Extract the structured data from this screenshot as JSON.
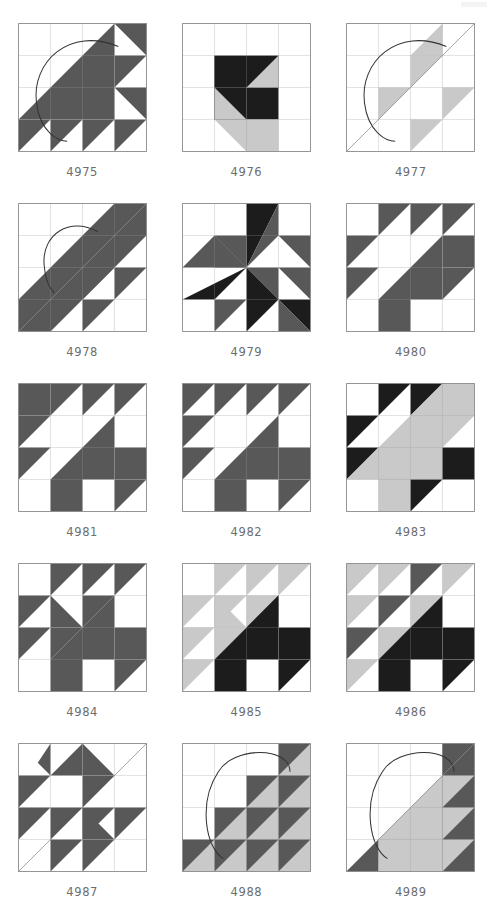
{
  "page": {
    "type": "quilt-block-pattern-catalog",
    "columns": 3,
    "rows": 5,
    "background": "#ffffff"
  },
  "palette": {
    "white": "#ffffff",
    "light_gray": "#c9c9c9",
    "mid_gray": "#585858",
    "dark": "#1c1c1c",
    "outline": "#8a8a8a",
    "curve_stroke": "#333333",
    "label_color": "#6d6d6d"
  },
  "blocks": [
    {
      "id": "4975",
      "label": "4975",
      "grid": 4,
      "has_curve": true,
      "curve_style": "teardrop-large",
      "shapes": [
        {
          "t": "poly",
          "p": "0,3 3,0 3,3",
          "c": "mid"
        },
        {
          "t": "poly",
          "p": "3,0 4,0 4,1",
          "c": "mid"
        },
        {
          "t": "poly",
          "p": "3,1 4,1 3,2",
          "c": "mid"
        },
        {
          "t": "poly",
          "p": "3,2 4,2 4,3",
          "c": "mid"
        },
        {
          "t": "poly",
          "p": "3,3 4,3 3,4",
          "c": "mid"
        },
        {
          "t": "poly",
          "p": "0,3 1,3 0,4",
          "c": "mid"
        },
        {
          "t": "poly",
          "p": "1,3 2,3 1,4",
          "c": "mid"
        },
        {
          "t": "poly",
          "p": "2,3 3,3 2,4",
          "c": "mid"
        }
      ]
    },
    {
      "id": "4976",
      "label": "4976",
      "grid": 4,
      "has_curve": false,
      "shapes": [
        {
          "t": "rect",
          "p": "1,1,2,1",
          "c": "dark"
        },
        {
          "t": "rect",
          "p": "1,2,1,1",
          "c": "dark"
        },
        {
          "t": "poly",
          "p": "1,1 2,2 1,2",
          "c": "dark"
        },
        {
          "t": "poly",
          "p": "1,2 2,2 2,3 1,3",
          "c": "dark"
        },
        {
          "t": "poly",
          "p": "2,2 3,2 3,3 2,3",
          "c": "dark"
        },
        {
          "t": "poly",
          "p": "1,2 2,3 1,3",
          "c": "light"
        },
        {
          "t": "poly",
          "p": "3,1 3,2 2,2",
          "c": "light"
        },
        {
          "t": "poly",
          "p": "1,3 3,3 3,4 2,4",
          "c": "light"
        }
      ]
    },
    {
      "id": "4977",
      "label": "4977",
      "grid": 4,
      "has_curve": true,
      "curve_style": "teardrop-large",
      "shapes": [
        {
          "t": "poly",
          "p": "1,2 2,2 1,3",
          "c": "light"
        },
        {
          "t": "poly",
          "p": "2,1 3,1 2,2",
          "c": "light"
        },
        {
          "t": "poly",
          "p": "3,0 3,1 2,1",
          "c": "light"
        },
        {
          "t": "poly",
          "p": "2,3 3,3 2,4",
          "c": "light"
        },
        {
          "t": "poly",
          "p": "3,2 4,2 3,3",
          "c": "light"
        }
      ]
    },
    {
      "id": "4978",
      "label": "4978",
      "grid": 4,
      "has_curve": true,
      "curve_style": "teardrop-small",
      "shapes": [
        {
          "t": "poly",
          "p": "0,3 3,0 4,0 4,1 1,4 0,4",
          "c": "mid"
        },
        {
          "t": "poly",
          "p": "2,1 3,1 2,2",
          "c": "mid"
        },
        {
          "t": "poly",
          "p": "2,2 3,2 2,3",
          "c": "mid"
        },
        {
          "t": "poly",
          "p": "1,2 2,2 1,3",
          "c": "mid"
        },
        {
          "t": "poly",
          "p": "3,2 4,2 3,3",
          "c": "mid"
        },
        {
          "t": "poly",
          "p": "2,3 3,3 2,4",
          "c": "mid"
        }
      ]
    },
    {
      "id": "4979",
      "label": "4979",
      "grid": 4,
      "has_curve": false,
      "curve_style": "star-burst",
      "shapes": [
        {
          "t": "poly",
          "p": "1,1 2,1 2,2",
          "c": "mid"
        },
        {
          "t": "poly",
          "p": "1,1 2,2 1,2",
          "c": "mid"
        },
        {
          "t": "poly",
          "p": "2,0 2,2 3,0",
          "c": "dark"
        },
        {
          "t": "poly",
          "p": "2,2 3,0 3,1",
          "c": "mid"
        },
        {
          "t": "poly",
          "p": "3,1 4,1 4,2",
          "c": "mid"
        },
        {
          "t": "poly",
          "p": "0,2 2,2 1,1",
          "c": "mid"
        },
        {
          "t": "poly",
          "p": "0,3 2,2 1,3",
          "c": "dark"
        },
        {
          "t": "poly",
          "p": "2,2 3,2 3,3",
          "c": "mid"
        },
        {
          "t": "poly",
          "p": "2,2 3,3 2,4",
          "c": "dark"
        },
        {
          "t": "poly",
          "p": "3,2 4,2 4,3",
          "c": "mid"
        },
        {
          "t": "poly",
          "p": "1,3 2,3 1,4",
          "c": "mid"
        },
        {
          "t": "poly",
          "p": "3,3 4,3 4,4",
          "c": "dark"
        },
        {
          "t": "poly",
          "p": "3,3 4,4 3,4",
          "c": "mid"
        }
      ]
    },
    {
      "id": "4980",
      "label": "4980",
      "grid": 4,
      "has_curve": false,
      "shapes": [
        {
          "t": "poly",
          "p": "1,0 2,0 1,1",
          "c": "mid"
        },
        {
          "t": "poly",
          "p": "2,0 3,0 2,1",
          "c": "mid"
        },
        {
          "t": "poly",
          "p": "3,0 4,0 3,1",
          "c": "mid"
        },
        {
          "t": "poly",
          "p": "0,1 1,1 0,2",
          "c": "mid"
        },
        {
          "t": "poly",
          "p": "0,2 1,2 0,3",
          "c": "mid"
        },
        {
          "t": "poly",
          "p": "1,3 3,1 3,3 2,3 2,4 1,4",
          "c": "mid"
        },
        {
          "t": "poly",
          "p": "3,1 4,1 4,2 3,2",
          "c": "mid"
        },
        {
          "t": "poly",
          "p": "3,2 4,2 3,3",
          "c": "mid"
        }
      ]
    },
    {
      "id": "4981",
      "label": "4981",
      "grid": 4,
      "has_curve": false,
      "shapes": [
        {
          "t": "rect",
          "p": "0,0,1,1",
          "c": "mid"
        },
        {
          "t": "poly",
          "p": "1,0 2,0 1,1",
          "c": "mid"
        },
        {
          "t": "poly",
          "p": "2,0 3,0 2,1",
          "c": "mid"
        },
        {
          "t": "poly",
          "p": "3,0 4,0 3,1",
          "c": "mid"
        },
        {
          "t": "poly",
          "p": "0,1 1,1 0,2",
          "c": "mid"
        },
        {
          "t": "poly",
          "p": "0,2 1,2 0,3",
          "c": "mid"
        },
        {
          "t": "poly",
          "p": "1,3 3,1 3,3 2,3 2,4 1,4",
          "c": "mid"
        },
        {
          "t": "poly",
          "p": "3,2 4,2 4,3 3,3",
          "c": "mid"
        },
        {
          "t": "poly",
          "p": "3,3 4,3 3,4",
          "c": "mid"
        }
      ]
    },
    {
      "id": "4982",
      "label": "4982",
      "grid": 4,
      "has_curve": false,
      "shapes": [
        {
          "t": "poly",
          "p": "0,0 1,0 0,1",
          "c": "mid"
        },
        {
          "t": "poly",
          "p": "1,0 2,0 1,1",
          "c": "mid"
        },
        {
          "t": "poly",
          "p": "2,0 3,0 2,1",
          "c": "mid"
        },
        {
          "t": "poly",
          "p": "3,0 4,0 3,1",
          "c": "mid"
        },
        {
          "t": "poly",
          "p": "0,1 1,1 0,2",
          "c": "mid"
        },
        {
          "t": "poly",
          "p": "0,2 1,2 0,3",
          "c": "mid"
        },
        {
          "t": "poly",
          "p": "1,3 3,1 3,3 2,3 2,4 1,4",
          "c": "mid"
        },
        {
          "t": "poly",
          "p": "3,2 4,2 4,3 3,3",
          "c": "mid"
        },
        {
          "t": "poly",
          "p": "3,3 4,3 3,4",
          "c": "mid"
        }
      ]
    },
    {
      "id": "4983",
      "label": "4983",
      "grid": 4,
      "has_curve": false,
      "shapes": [
        {
          "t": "poly",
          "p": "1,0 2,0 1,1",
          "c": "dark"
        },
        {
          "t": "poly",
          "p": "2,0 3,0 2,1",
          "c": "dark"
        },
        {
          "t": "poly",
          "p": "0,1 1,1 0,2",
          "c": "dark"
        },
        {
          "t": "poly",
          "p": "0,2 1,2 0,3",
          "c": "dark"
        },
        {
          "t": "poly",
          "p": "0,3 3,0 4,0 4,1 2,3 2,4 1,4 1,3",
          "c": "light"
        },
        {
          "t": "poly",
          "p": "2,2 3,2 3,3 2,3",
          "c": "light"
        },
        {
          "t": "poly",
          "p": "2,3 3,2 3,3",
          "c": "light"
        },
        {
          "t": "poly",
          "p": "3,2 4,2 4,3 3,3",
          "c": "dark"
        },
        {
          "t": "poly",
          "p": "2,3 3,3 2,4",
          "c": "dark"
        }
      ]
    },
    {
      "id": "4984",
      "label": "4984",
      "grid": 4,
      "has_curve": false,
      "shapes": [
        {
          "t": "poly",
          "p": "1,0 2,0 1,1",
          "c": "mid"
        },
        {
          "t": "poly",
          "p": "2,0 3,0 2,1",
          "c": "mid"
        },
        {
          "t": "poly",
          "p": "3,0 4,0 3,1",
          "c": "mid"
        },
        {
          "t": "poly",
          "p": "0,1 1,1 0,2",
          "c": "mid"
        },
        {
          "t": "poly",
          "p": "0,2 1,2 0,3",
          "c": "mid"
        },
        {
          "t": "poly",
          "p": "2,1 3,1 2,2",
          "c": "mid"
        },
        {
          "t": "poly",
          "p": "1,1 2,2 1,2",
          "c": "mid"
        },
        {
          "t": "poly",
          "p": "1,2 2,2 1,3",
          "c": "mid"
        },
        {
          "t": "poly",
          "p": "1,3 3,1 3,3 2,3 2,4 1,4",
          "c": "mid"
        },
        {
          "t": "poly",
          "p": "3,2 4,2 4,3 3,3",
          "c": "mid"
        },
        {
          "t": "poly",
          "p": "3,3 4,3 3,4",
          "c": "mid"
        }
      ]
    },
    {
      "id": "4985",
      "label": "4985",
      "grid": 4,
      "has_curve": false,
      "shapes": [
        {
          "t": "poly",
          "p": "1,0 2,0 1,1",
          "c": "light"
        },
        {
          "t": "poly",
          "p": "2,0 3,0 2,1",
          "c": "light"
        },
        {
          "t": "poly",
          "p": "3,0 4,0 3,1",
          "c": "light"
        },
        {
          "t": "poly",
          "p": "0,1 1,1 0,2",
          "c": "light"
        },
        {
          "t": "poly",
          "p": "1,1 2,1 1,2",
          "c": "light"
        },
        {
          "t": "poly",
          "p": "2,1 3,1 2,2",
          "c": "light"
        },
        {
          "t": "poly",
          "p": "0,2 1,2 0,3",
          "c": "light"
        },
        {
          "t": "poly",
          "p": "1,2 2,2 1,3",
          "c": "light"
        },
        {
          "t": "poly",
          "p": "0,3 1,3 0,4",
          "c": "light"
        },
        {
          "t": "poly",
          "p": "1,1 2,2 1,2",
          "c": "light"
        },
        {
          "t": "poly",
          "p": "2,2 3,1 3,2",
          "c": "dark"
        },
        {
          "t": "poly",
          "p": "1,3 3,1 3,3 2,3 2,4 1,4",
          "c": "dark"
        },
        {
          "t": "poly",
          "p": "3,2 4,2 4,3 3,3",
          "c": "dark"
        },
        {
          "t": "poly",
          "p": "3,3 4,3 3,4",
          "c": "dark"
        }
      ]
    },
    {
      "id": "4986",
      "label": "4986",
      "grid": 4,
      "has_curve": false,
      "shapes": [
        {
          "t": "poly",
          "p": "0,0 1,0 0,1",
          "c": "light"
        },
        {
          "t": "poly",
          "p": "1,0 2,0 1,1",
          "c": "light"
        },
        {
          "t": "poly",
          "p": "2,0 3,0 2,1",
          "c": "mid"
        },
        {
          "t": "poly",
          "p": "3,0 4,0 3,1",
          "c": "light"
        },
        {
          "t": "poly",
          "p": "0,1 1,1 0,2",
          "c": "light"
        },
        {
          "t": "poly",
          "p": "1,1 2,1 1,2",
          "c": "mid"
        },
        {
          "t": "poly",
          "p": "2,1 3,1 2,2",
          "c": "light"
        },
        {
          "t": "poly",
          "p": "0,2 1,2 0,3",
          "c": "mid"
        },
        {
          "t": "poly",
          "p": "1,2 2,2 1,3",
          "c": "light"
        },
        {
          "t": "poly",
          "p": "0,3 1,3 0,4",
          "c": "light"
        },
        {
          "t": "poly",
          "p": "1,3 3,1 3,3 2,3 2,4 1,4",
          "c": "dark"
        },
        {
          "t": "poly",
          "p": "3,2 4,2 4,3 3,3",
          "c": "dark"
        },
        {
          "t": "poly",
          "p": "3,3 4,3 3,4",
          "c": "dark"
        }
      ]
    },
    {
      "id": "4987",
      "label": "4987",
      "grid": 4,
      "has_curve": false,
      "curve_style": "diagonal-frame",
      "shapes": [
        {
          "t": "poly",
          "p": "1,0 1,1 0.6,0.6",
          "c": "mid"
        },
        {
          "t": "poly",
          "p": "1,1 2,0 2,1",
          "c": "mid"
        },
        {
          "t": "poly",
          "p": "0,1 1,1 0,2",
          "c": "mid"
        },
        {
          "t": "poly",
          "p": "0,2 1,2 0,3",
          "c": "mid"
        },
        {
          "t": "poly",
          "p": "2,0 3,1 2,1",
          "c": "mid"
        },
        {
          "t": "poly",
          "p": "2,1 3,1 2,2",
          "c": "mid"
        },
        {
          "t": "poly",
          "p": "2,2 3,2 2,3",
          "c": "mid"
        },
        {
          "t": "poly",
          "p": "1,2 2,2 1,3",
          "c": "mid"
        },
        {
          "t": "poly",
          "p": "1,3 2,3 1,4",
          "c": "mid"
        },
        {
          "t": "poly",
          "p": "2,3 3,3 2,4",
          "c": "mid"
        },
        {
          "t": "poly",
          "p": "3,2 4,2 3,3",
          "c": "mid"
        },
        {
          "t": "poly",
          "p": "2,2 3,3 2,3",
          "c": "mid"
        }
      ]
    },
    {
      "id": "4988",
      "label": "4988",
      "grid": 4,
      "has_curve": true,
      "curve_style": "circle",
      "shapes": [
        {
          "t": "poly",
          "p": "0,4 4,0 4,4",
          "c": "light"
        },
        {
          "t": "poly",
          "p": "3,0 4,0 3,1",
          "c": "mid"
        },
        {
          "t": "poly",
          "p": "2,1 3,1 2,2",
          "c": "mid"
        },
        {
          "t": "poly",
          "p": "3,1 4,1 3,2",
          "c": "mid"
        },
        {
          "t": "poly",
          "p": "1,2 2,2 1,3",
          "c": "mid"
        },
        {
          "t": "poly",
          "p": "2,2 3,2 2,3",
          "c": "mid"
        },
        {
          "t": "poly",
          "p": "3,2 4,2 3,3",
          "c": "mid"
        },
        {
          "t": "poly",
          "p": "0,3 1,3 0,4",
          "c": "mid"
        },
        {
          "t": "poly",
          "p": "1,3 2,3 1,4",
          "c": "mid"
        },
        {
          "t": "poly",
          "p": "2,3 3,3 2,4",
          "c": "mid"
        },
        {
          "t": "poly",
          "p": "3,3 4,3 3,4",
          "c": "mid"
        }
      ]
    },
    {
      "id": "4989",
      "label": "4989",
      "grid": 4,
      "has_curve": true,
      "curve_style": "circle",
      "shapes": [
        {
          "t": "poly",
          "p": "1,3 3,1 3,4 1,4",
          "c": "light"
        },
        {
          "t": "poly",
          "p": "3,0 4,0 3,1",
          "c": "mid"
        },
        {
          "t": "poly",
          "p": "3,0 4,0 4,4 3,4",
          "c": "mid"
        },
        {
          "t": "poly",
          "p": "3,1 4,1 3,2",
          "c": "light"
        },
        {
          "t": "poly",
          "p": "3,2 4,2 3,3",
          "c": "light"
        },
        {
          "t": "poly",
          "p": "0,4 1,3 1,4",
          "c": "mid"
        },
        {
          "t": "poly",
          "p": "1,3 2,3 1,4",
          "c": "light"
        },
        {
          "t": "poly",
          "p": "2,3 3,3 2,4",
          "c": "light"
        },
        {
          "t": "poly",
          "p": "3,3 4,3 3,4",
          "c": "light"
        }
      ]
    }
  ]
}
